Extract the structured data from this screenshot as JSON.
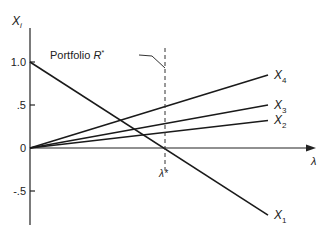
{
  "chart_data": {
    "type": "line",
    "title": "",
    "xlabel": "λ",
    "ylabel": "X_i",
    "ylim": [
      -0.75,
      1.15
    ],
    "yticks": [
      {
        "label": "1.0",
        "value": 1.0
      },
      {
        "label": ".5",
        "value": 0.5
      },
      {
        "label": "0",
        "value": 0
      },
      {
        "label": "-.5",
        "value": -0.5
      }
    ],
    "x": [
      0,
      1
    ],
    "series": [
      {
        "name": "X_1",
        "label_main": "X",
        "label_sub": "1",
        "values": [
          1.0,
          -0.78
        ]
      },
      {
        "name": "X_2",
        "label_main": "X",
        "label_sub": "2",
        "values": [
          0,
          0.32
        ]
      },
      {
        "name": "X_3",
        "label_main": "X",
        "label_sub": "3",
        "values": [
          0,
          0.5
        ]
      },
      {
        "name": "X_4",
        "label_main": "X",
        "label_sub": "4",
        "values": [
          0,
          0.85
        ]
      }
    ],
    "annotations": [
      {
        "text": "Portfolio R*",
        "type": "vertical-dashed-line",
        "x_label": "λ*",
        "x_fraction": 0.56
      }
    ],
    "grid": false,
    "legend": "inline-labels-at-line-ends"
  },
  "labels": {
    "y_axis_main": "X",
    "y_axis_sub": "i",
    "x_axis": "λ",
    "portfolio_text": "Portfolio ",
    "portfolio_R": "R",
    "portfolio_star": "*",
    "lambda_star": "λ*"
  }
}
